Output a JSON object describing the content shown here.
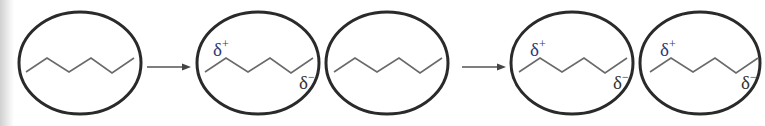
{
  "diagram": {
    "type": "induced dipole sequence (London dispersion)",
    "colors": {
      "ellipse_stroke": "#2a2a2a",
      "chain_stroke": "#6a6a6a",
      "delta_plus": "#2b3a78",
      "delta_minus": "#333333"
    },
    "molecules": [
      {
        "id": 1,
        "polarized": false
      },
      {
        "id": 2,
        "polarized": true,
        "label_plus": "δ",
        "label_plus_sup": "+",
        "label_minus": "δ",
        "label_minus_sup": "−"
      },
      {
        "id": 3,
        "polarized": false
      },
      {
        "id": 4,
        "polarized": true,
        "label_plus": "δ",
        "label_plus_sup": "+",
        "label_minus": "δ",
        "label_minus_sup": "−"
      },
      {
        "id": 5,
        "polarized": true,
        "label_plus": "δ",
        "label_plus_sup": "+",
        "label_minus": "δ",
        "label_minus_sup": "−"
      }
    ],
    "arrows": [
      {
        "from": 1,
        "to": 2
      },
      {
        "from": 3,
        "to": 4
      }
    ]
  }
}
